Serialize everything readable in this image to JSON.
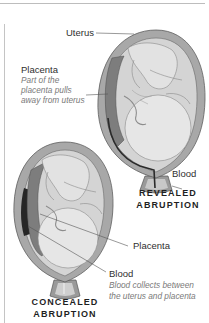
{
  "diagram": {
    "top_figure": {
      "caption_line1": "REVEALED",
      "caption_line2": "ABRUPTION",
      "labels": {
        "uterus": "Uterus",
        "placenta": "Placenta",
        "placenta_note_line1": "Part of the",
        "placenta_note_line2": "placenta pulls",
        "placenta_note_line3": "away from uterus",
        "blood": "Blood"
      }
    },
    "bottom_figure": {
      "caption_line1": "CONCEALED",
      "caption_line2": "ABRUPTION",
      "labels": {
        "placenta": "Placenta",
        "blood": "Blood",
        "blood_note_line1": "Blood collects between",
        "blood_note_line2": "the uterus and placenta"
      }
    },
    "colors": {
      "uterus_wall": "#9a9a9a",
      "uterus_inner": "#d6d6d6",
      "placenta": "#7d7d7d",
      "blood": "#2a2a2a",
      "fetus": "#e6e6e6",
      "leader_line": "#555555"
    }
  }
}
